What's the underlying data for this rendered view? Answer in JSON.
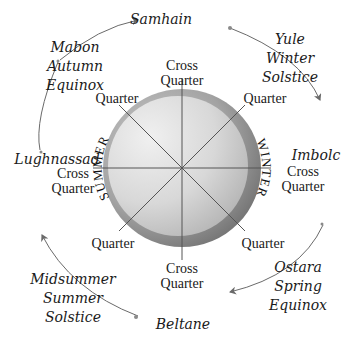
{
  "diagram": {
    "colors": {
      "outer_ring": "#8e8e8e",
      "inner_disk_light": "#e6e6e6",
      "inner_disk_dark": "#b0b0b0",
      "lines": "#555555",
      "arrows": "#6a6a6a",
      "text": "#1a1a1a"
    },
    "wheel": {
      "left_half_label": "SUMMER",
      "right_half_label": "WINTER"
    },
    "festivals": {
      "samhain": {
        "name": "Samhain"
      },
      "yule": {
        "name": "Yule",
        "line2": "Winter",
        "line3": "Solstice"
      },
      "imbolc": {
        "name": "Imbolc"
      },
      "ostara": {
        "name": "Ostara",
        "line2": "Spring",
        "line3": "Equinox"
      },
      "beltane": {
        "name": "Beltane"
      },
      "midsummer": {
        "name": "Midsummer",
        "line2": "Summer",
        "line3": "Solstice"
      },
      "lughnassad": {
        "name": "Lughnassad"
      },
      "mabon": {
        "name": "Mabon",
        "line2": "Autumn",
        "line3": "Equinox"
      }
    },
    "markers": {
      "top": {
        "line1": "Cross",
        "line2": "Quarter"
      },
      "top_right": {
        "line1": "Quarter"
      },
      "right": {
        "line1": "Cross",
        "line2": "Quarter"
      },
      "bottom_right": {
        "line1": "Quarter"
      },
      "bottom": {
        "line1": "Cross",
        "line2": "Quarter"
      },
      "bottom_left": {
        "line1": "Quarter"
      },
      "left": {
        "line1": "Cross",
        "line2": "Quarter"
      },
      "top_left": {
        "line1": "Quarter"
      }
    }
  }
}
